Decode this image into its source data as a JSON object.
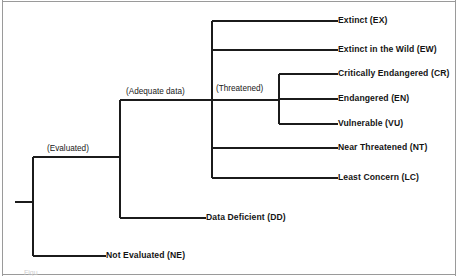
{
  "diagram": {
    "type": "hierarchical-bracket-tree",
    "line_color": "#1b1b1b",
    "background_color": "#ffffff",
    "border_color": "#9a9a9a",
    "root_stem_label": "",
    "internal_nodes": [
      {
        "id": "evaluated",
        "label": "(Evaluated)",
        "x": 47,
        "y": 145
      },
      {
        "id": "adequate-data",
        "label": "(Adequate data)",
        "x": 126,
        "y": 88
      },
      {
        "id": "threatened",
        "label": "(Threatened)",
        "x": 216,
        "y": 85
      }
    ],
    "leaves": [
      {
        "id": "extinct",
        "label": "Extinct (EX)",
        "x": 338,
        "y": 16,
        "line_from_x": 212,
        "line_y": 21
      },
      {
        "id": "extinct-in-the-wild",
        "label": "Extinct in the Wild (EW)",
        "x": 338,
        "y": 45,
        "line_from_x": 212,
        "line_y": 50
      },
      {
        "id": "critically-endangered",
        "label": "Critically Endangered (CR)",
        "x": 338,
        "y": 69,
        "line_from_x": 279,
        "line_y": 74
      },
      {
        "id": "endangered",
        "label": "Endangered (EN)",
        "x": 338,
        "y": 94,
        "line_from_x": 279,
        "line_y": 99
      },
      {
        "id": "vulnerable",
        "label": "Vulnerable (VU)",
        "x": 338,
        "y": 119,
        "line_from_x": 279,
        "line_y": 124
      },
      {
        "id": "near-threatened",
        "label": "Near Threatened (NT)",
        "x": 338,
        "y": 143,
        "line_from_x": 212,
        "line_y": 148
      },
      {
        "id": "least-concern",
        "label": "Least Concern (LC)",
        "x": 338,
        "y": 173,
        "line_from_x": 212,
        "line_y": 178
      },
      {
        "id": "data-deficient",
        "label": "Data Deficient (DD)",
        "x": 206,
        "y": 213,
        "line_from_x": 120,
        "line_y": 218
      },
      {
        "id": "not-evaluated",
        "label": "Not Evaluated (NE)",
        "x": 106,
        "y": 251,
        "line_from_x": 33,
        "line_y": 256
      }
    ],
    "connectors": {
      "root_stem": {
        "x1": 15,
        "y1": 202,
        "x2": 33,
        "y2": 202
      },
      "root_vertical": {
        "x": 33,
        "y1": 157,
        "y2": 256
      },
      "evaluated_horizontal": {
        "x1": 33,
        "y1": 157,
        "x2": 120,
        "y2": 157
      },
      "adequate_vertical": {
        "x": 120,
        "y1": 100,
        "y2": 218
      },
      "adequate_horizontal": {
        "x1": 120,
        "y1": 100,
        "x2": 212,
        "y2": 100
      },
      "threatened_vertical": {
        "x": 212,
        "y1": 21,
        "y2": 178
      },
      "threatened_horizontal": {
        "x1": 212,
        "y1": 100,
        "x2": 279,
        "y2": 100
      },
      "inner_threatened_vertical": {
        "x": 279,
        "y1": 74,
        "y2": 124
      }
    },
    "page_borders": {
      "left_x": 2,
      "right_x": 455,
      "top_y": 0,
      "bottom_y": 276
    },
    "caption_fragment": "Figu"
  }
}
